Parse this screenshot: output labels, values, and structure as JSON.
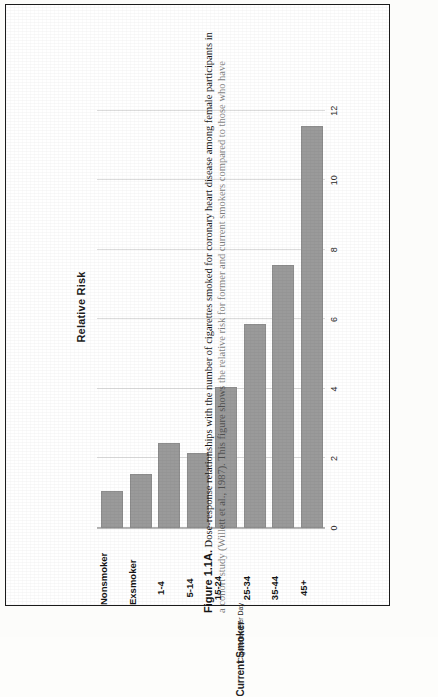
{
  "figure": {
    "caption_number": "Figure 1.1A.",
    "caption_line1": "Dose-response relationships with the number of cigarettes smoked for coronary heart disease among female participants in",
    "caption_line2": "a cohort study (Willett et al., 1987). This figure shows the relative risk for former and current smokers compared to those who have"
  },
  "chart_data": {
    "type": "bar",
    "orientation": "horizontal-printed-sideways",
    "title": "Relative Risk",
    "xlabel": "",
    "ylabel": "Relative Risk",
    "categories": [
      "Nonsmoker",
      "Exsmoker",
      "1-4",
      "5-14",
      "15-24",
      "25-34",
      "35-44",
      "45+"
    ],
    "values": [
      1.0,
      1.5,
      2.4,
      2.1,
      4.0,
      5.8,
      7.5,
      11.5
    ],
    "value_axis_ticks": [
      "0",
      "2",
      "4",
      "6",
      "8",
      "10",
      "12"
    ],
    "value_axis_tick_values": [
      0,
      2,
      4,
      6,
      8,
      10,
      12
    ],
    "xlim": [
      0,
      13
    ],
    "grid": true,
    "legend": "none",
    "bar_color": "#9a9a9a",
    "group_annotations": [
      {
        "label": "Cigarettes Per Day",
        "covers": [
          "1-4",
          "5-14",
          "15-24",
          "25-34",
          "35-44",
          "45+"
        ]
      },
      {
        "label": "Current Smoker",
        "covers": [
          "1-4",
          "5-14",
          "15-24",
          "25-34",
          "35-44",
          "45+"
        ]
      }
    ]
  }
}
